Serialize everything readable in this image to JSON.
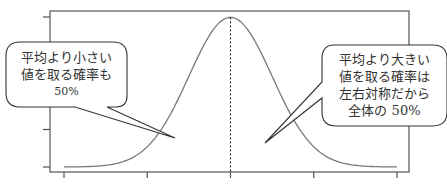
{
  "chart_data": {
    "type": "line",
    "title": "",
    "title_note": "Title is cut off at the top edge; only the bottom fragment of the glyphs is visible.",
    "xlabel": "",
    "ylabel": "",
    "x_ticks": [
      "",
      "",
      "",
      "",
      ""
    ],
    "y_ticks": [
      "",
      "",
      "",
      "",
      ""
    ],
    "tick_labels_visible": false,
    "grid": false,
    "legend": null,
    "series": [
      {
        "name": "normal-density",
        "x": [
          -4,
          -3.5,
          -3,
          -2.5,
          -2,
          -1.5,
          -1,
          -0.5,
          0,
          0.5,
          1,
          1.5,
          2,
          2.5,
          3,
          3.5,
          4
        ],
        "values": [
          0.0001,
          0.0009,
          0.0044,
          0.0175,
          0.054,
          0.1295,
          0.242,
          0.3521,
          0.3989,
          0.3521,
          0.242,
          0.1295,
          0.054,
          0.0175,
          0.0044,
          0.0009,
          0.0001
        ]
      }
    ],
    "mean_line": {
      "x": 0,
      "style": "dashed"
    },
    "xlim": [
      -4,
      4
    ],
    "ylim": [
      0,
      0.4
    ],
    "annotations": [
      {
        "position": "left",
        "lines": [
          "平均より小さい",
          "値を取る確率も",
          "50%"
        ]
      },
      {
        "position": "right",
        "lines": [
          "平均より大きい",
          "値を取る確率は",
          "左右対称だから",
          "全体の 50%"
        ]
      }
    ]
  },
  "colors": {
    "curve": "#7a7a7a",
    "axis": "#555555",
    "text": "#333333",
    "callout_border": "#333333",
    "background": "#ffffff"
  }
}
